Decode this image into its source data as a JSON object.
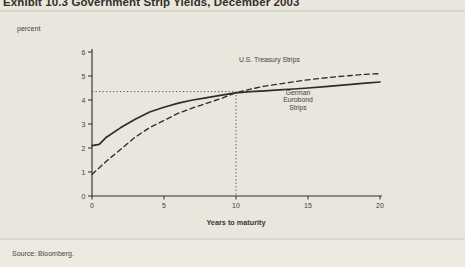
{
  "header": {
    "title": "Exhibit 10.3 Government Strip Yields, December 2003"
  },
  "chart_data": {
    "type": "line",
    "title": "Exhibit 10.3 Government Strip Yields, December 2003",
    "xlabel": "Years to maturity",
    "ylabel": "percent",
    "xlim": [
      0,
      20
    ],
    "ylim": [
      0,
      6
    ],
    "x_ticks": [
      0,
      5,
      10,
      15,
      20
    ],
    "y_ticks": [
      0,
      1,
      2,
      3,
      4,
      5,
      6
    ],
    "grid": false,
    "legend_position": "inline-annotations",
    "line_color": "#2f2d29",
    "guide_lines": {
      "style": "dotted",
      "x_value": 10,
      "y_value": 4.35
    },
    "series": [
      {
        "name": "U.S. Treasury Strips",
        "style": "dashed",
        "x": [
          0,
          1,
          2,
          3,
          4,
          5,
          6,
          7,
          8,
          9,
          10,
          11,
          12,
          13,
          14,
          15,
          16,
          17,
          18,
          19,
          20
        ],
        "y": [
          0.9,
          1.45,
          1.95,
          2.45,
          2.85,
          3.15,
          3.45,
          3.67,
          3.87,
          4.07,
          4.3,
          4.45,
          4.58,
          4.67,
          4.76,
          4.84,
          4.91,
          4.97,
          5.02,
          5.07,
          5.1
        ]
      },
      {
        "name": "German Eurobond Strips",
        "style": "solid",
        "x": [
          0,
          0.5,
          1,
          2,
          3,
          4,
          5,
          6,
          7,
          8,
          9,
          10,
          11,
          12,
          13,
          14,
          15,
          16,
          17,
          18,
          19,
          20
        ],
        "y": [
          2.1,
          2.15,
          2.45,
          2.85,
          3.2,
          3.5,
          3.7,
          3.87,
          4.0,
          4.1,
          4.2,
          4.3,
          4.35,
          4.38,
          4.42,
          4.46,
          4.5,
          4.55,
          4.6,
          4.65,
          4.7,
          4.75
        ]
      }
    ]
  },
  "footer": {
    "source": "Source: Bloomberg."
  }
}
